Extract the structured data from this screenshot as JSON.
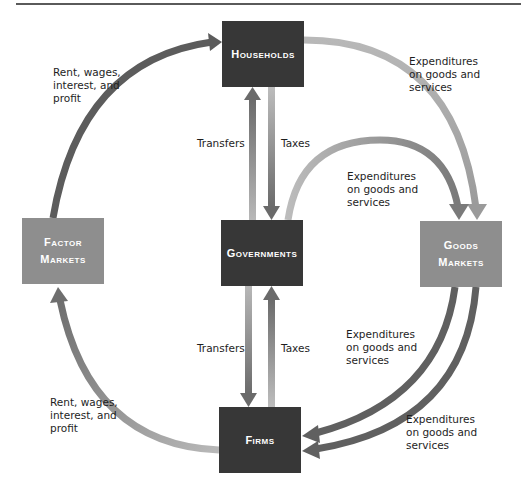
{
  "diagram": {
    "nodes": {
      "households": {
        "label": "Households"
      },
      "factor_markets": {
        "label_line1": "Factor",
        "label_line2": "Markets"
      },
      "governments": {
        "label": "Governments"
      },
      "goods_markets": {
        "label_line1": "Goods",
        "label_line2": "Markets"
      },
      "firms": {
        "label": "Firms"
      }
    },
    "flows": {
      "factor_to_households": {
        "line1": "Rent, wages,",
        "line2": "interest, and",
        "line3": "profit"
      },
      "households_to_goods": {
        "line1": "Expenditures",
        "line2": "on goods and",
        "line3": "services"
      },
      "gov_to_goods": {
        "line1": "Expenditures",
        "line2": "on goods and",
        "line3": "services"
      },
      "goods_to_firms_gov": {
        "line1": "Expenditures",
        "line2": "on goods and",
        "line3": "services"
      },
      "goods_to_firms_hh": {
        "line1": "Expenditures",
        "line2": "on goods and",
        "line3": "services"
      },
      "firms_to_factor": {
        "line1": "Rent, wages,",
        "line2": "interest, and",
        "line3": "profit"
      },
      "upper_transfers": "Transfers",
      "upper_taxes": "Taxes",
      "lower_transfers": "Transfers",
      "lower_taxes": "Taxes"
    },
    "colors": {
      "dark_box": "#373737",
      "mid_box": "#8e8e8e",
      "dark_arrow": "#5c5c5c",
      "light_arrow": "#b4b4b4"
    }
  }
}
